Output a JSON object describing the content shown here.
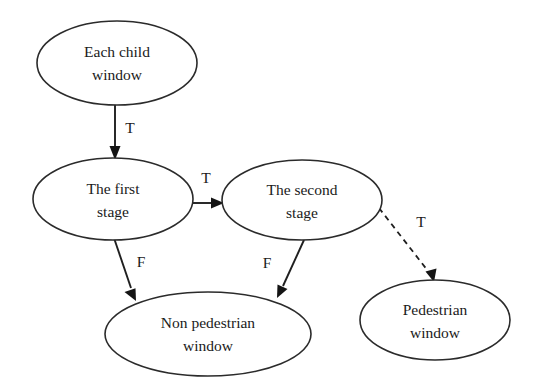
{
  "diagram": {
    "type": "flowchart",
    "background_color": "#ffffff",
    "stroke_color": "#2b2b2b",
    "text_color": "#1a1a1a",
    "nodes": [
      {
        "id": "each-child-window",
        "shape": "ellipse",
        "line1": "Each child",
        "line2": "window",
        "cx": 117,
        "cy": 63,
        "rx": 80,
        "ry": 42
      },
      {
        "id": "the-first-stage",
        "shape": "ellipse",
        "line1": "The first",
        "line2": "stage",
        "cx": 113,
        "cy": 199,
        "rx": 80,
        "ry": 41
      },
      {
        "id": "the-second-stage",
        "shape": "ellipse",
        "line1": "The second",
        "line2": "stage",
        "cx": 302,
        "cy": 200,
        "rx": 80,
        "ry": 40
      },
      {
        "id": "non-pedestrian-window",
        "shape": "ellipse",
        "line1": "Non pedestrian",
        "line2": "window",
        "cx": 208,
        "cy": 334,
        "rx": 103,
        "ry": 42
      },
      {
        "id": "pedestrian-window",
        "shape": "ellipse",
        "line1": "Pedestrian",
        "line2": "window",
        "cx": 435,
        "cy": 320,
        "rx": 75,
        "ry": 40
      }
    ],
    "edges": [
      {
        "id": "child-to-first",
        "from": "each-child-window",
        "to": "the-first-stage",
        "label": "T",
        "style": "solid",
        "label_x": 130,
        "label_y": 129
      },
      {
        "id": "first-to-second",
        "from": "the-first-stage",
        "to": "the-second-stage",
        "label": "T",
        "style": "solid",
        "label_x": 206,
        "label_y": 179
      },
      {
        "id": "first-to-nonpedestrian",
        "from": "the-first-stage",
        "to": "non-pedestrian-window",
        "label": "F",
        "style": "solid",
        "label_x": 141,
        "label_y": 263
      },
      {
        "id": "second-to-nonpedestrian",
        "from": "the-second-stage",
        "to": "non-pedestrian-window",
        "label": "F",
        "style": "solid",
        "label_x": 267,
        "label_y": 264
      },
      {
        "id": "second-to-pedestrian",
        "from": "the-second-stage",
        "to": "pedestrian-window",
        "label": "T",
        "style": "dashed",
        "label_x": 421,
        "label_y": 223
      }
    ]
  }
}
